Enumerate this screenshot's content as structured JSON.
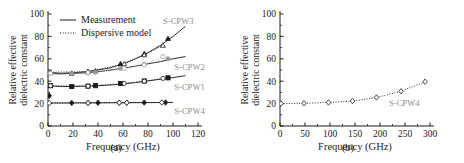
{
  "figure": {
    "panels": [
      {
        "id": "a",
        "caption": "(a)",
        "ylabel_line1": "Relative effective",
        "ylabel_line2": "dielectric constant",
        "xlabel": "Frequency (GHz)",
        "legend": [
          {
            "label": "Measurement",
            "style": "solid"
          },
          {
            "label": "Dispersive model",
            "style": "dotted"
          }
        ],
        "curve_labels": [
          {
            "text": "S-CPW3",
            "x": 92,
            "y": 91
          },
          {
            "text": "S-CPW2",
            "x": 101,
            "y": 50
          },
          {
            "text": "S-CPW1",
            "x": 101,
            "y": 32
          },
          {
            "text": "S-CPW4",
            "x": 101,
            "y": 11
          }
        ]
      },
      {
        "id": "b",
        "caption": "(b)",
        "ylabel_line1": "Relative effective",
        "ylabel_line2": "dielectric constant",
        "xlabel": "Frequency (GHz)",
        "curve_labels": [
          {
            "text": "S-CPW4",
            "x": 218,
            "y": 18
          }
        ]
      }
    ]
  },
  "chart_data": [
    {
      "type": "line",
      "panel": "a",
      "title": "",
      "xlabel": "Frequency (GHz)",
      "ylabel": "Relative effective dielectric constant",
      "xlim": [
        0,
        120
      ],
      "ylim": [
        0,
        100
      ],
      "xticks": [
        0,
        20,
        40,
        60,
        80,
        100,
        120
      ],
      "yticks": [
        0,
        20,
        40,
        60,
        80,
        100
      ],
      "grid": false,
      "legend": [
        "Measurement",
        "Dispersive model"
      ],
      "legend_position": "top-left",
      "series": [
        {
          "name": "S-CPW3 measurement",
          "style": "solid",
          "marker": "none",
          "x": [
            0,
            10,
            20,
            30,
            40,
            50,
            60,
            70,
            80,
            90,
            100,
            110
          ],
          "y": [
            48,
            47,
            47.5,
            48.5,
            50,
            52,
            55.5,
            60,
            65.5,
            72,
            80,
            89
          ]
        },
        {
          "name": "S-CPW3 measurement markers",
          "style": "none",
          "marker": "filled-triangle",
          "x": [
            2,
            19,
            32,
            38,
            58,
            77,
            96
          ],
          "y": [
            48,
            47,
            48.5,
            49,
            55.5,
            64.5,
            78
          ]
        },
        {
          "name": "S-CPW3 dispersive model",
          "style": "dotted",
          "marker": "open-triangle",
          "x": [
            2,
            32,
            61,
            77,
            92
          ],
          "y": [
            48,
            48.5,
            55.5,
            63.5,
            72
          ]
        },
        {
          "name": "S-CPW2 measurement",
          "style": "solid",
          "marker": "none",
          "x": [
            0,
            10,
            20,
            30,
            40,
            50,
            60,
            70,
            80,
            90,
            100,
            110
          ],
          "y": [
            47,
            46.5,
            47,
            47.5,
            48.5,
            50,
            51.5,
            53.5,
            55.5,
            57.5,
            60,
            62
          ]
        },
        {
          "name": "S-CPW2 measurement markers",
          "style": "none",
          "marker": "filled-circle-grey",
          "x": [
            2,
            19,
            32,
            38,
            58,
            77,
            96
          ],
          "y": [
            47,
            46.5,
            47.5,
            48,
            51.5,
            55,
            60
          ]
        },
        {
          "name": "S-CPW2 dispersive model",
          "style": "dotted",
          "marker": "open-circle-grey",
          "x": [
            2,
            32,
            61,
            77,
            92
          ],
          "y": [
            47,
            47.5,
            51.5,
            54.5,
            62
          ]
        },
        {
          "name": "S-CPW1 measurement",
          "style": "solid",
          "marker": "none",
          "x": [
            0,
            10,
            20,
            30,
            40,
            50,
            60,
            70,
            80,
            90,
            100,
            110
          ],
          "y": [
            36,
            35.2,
            35.3,
            35.6,
            36,
            36.6,
            37.5,
            38.8,
            40.2,
            41.8,
            43.2,
            45
          ]
        },
        {
          "name": "S-CPW1 measurement markers",
          "style": "none",
          "marker": "filled-square",
          "x": [
            2,
            19,
            32,
            38,
            58,
            77,
            96
          ],
          "y": [
            36,
            35.2,
            35.6,
            36,
            38,
            40.2,
            43
          ]
        },
        {
          "name": "S-CPW1 dispersive model",
          "style": "dotted",
          "marker": "open-circle",
          "x": [
            2,
            32,
            61,
            77,
            92
          ],
          "y": [
            36,
            35.6,
            38,
            40,
            42.5
          ]
        },
        {
          "name": "S-CPW4 measurement",
          "style": "solid",
          "marker": "none",
          "x": [
            0,
            20,
            40,
            60,
            80,
            100
          ],
          "y": [
            20.5,
            20.6,
            20.7,
            20.8,
            20.9,
            21
          ]
        },
        {
          "name": "S-CPW4 measurement markers",
          "style": "none",
          "marker": "filled-diamond",
          "x": [
            1,
            19,
            32,
            40,
            57,
            63,
            77,
            94
          ],
          "y": [
            27,
            20.6,
            20.6,
            20.7,
            20.8,
            20.8,
            20.9,
            21
          ]
        },
        {
          "name": "S-CPW4 dispersive model",
          "style": "dotted",
          "marker": "open-diamond",
          "x": [
            1,
            32,
            57,
            63,
            91
          ],
          "y": [
            20.5,
            20.6,
            20.8,
            20.8,
            21
          ]
        }
      ]
    },
    {
      "type": "line",
      "panel": "b",
      "title": "",
      "xlabel": "Frequency (GHz)",
      "ylabel": "Relative effective dielectric constant",
      "xlim": [
        0,
        300
      ],
      "ylim": [
        0,
        100
      ],
      "xticks": [
        0,
        50,
        100,
        150,
        200,
        250,
        300
      ],
      "yticks": [
        0,
        20,
        40,
        60,
        80,
        100
      ],
      "grid": false,
      "series": [
        {
          "name": "S-CPW4 dispersive model",
          "style": "dotted",
          "marker": "open-diamond",
          "x": [
            2,
            48,
            97,
            145,
            193,
            242,
            290
          ],
          "y": [
            20,
            20.3,
            21,
            22.3,
            25.5,
            31,
            39.5
          ]
        }
      ]
    }
  ],
  "colors": {
    "axis": "#1a1a1a",
    "series_black": "#1a1a1a",
    "series_grey": "#9a9a9a",
    "label_grey": "#8c8c8c",
    "background": "#ffffff"
  }
}
